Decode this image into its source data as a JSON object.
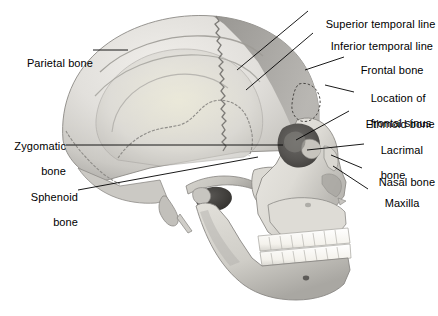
{
  "figure": {
    "width": 438,
    "height": 316,
    "background_color": "#ffffff",
    "label_color": "#000000",
    "leader_line_color": "#000000"
  },
  "palette": {
    "bone_light": "#e8e6e2",
    "bone_mid": "#cfcdc8",
    "bone_shadow": "#a9a7a3",
    "frontal_bone_gray": "#9a9894",
    "parietal_gray": "#c6c4c0",
    "suture_line": "#8a8884",
    "orbit_dark": "#4a4845",
    "meatus_dark": "#3c3a38",
    "tooth_white": "#fbfaf7",
    "outline": "#6e6c69"
  },
  "labels": {
    "left": [
      {
        "id": "parietal-bone",
        "lines": [
          "Parietal bone"
        ],
        "text": "Parietal bone",
        "align": "right",
        "x": 8,
        "y": 44,
        "leader": {
          "x1": 93,
          "y1": 50,
          "x2": 128,
          "y2": 50
        }
      },
      {
        "id": "zygomatic-bone",
        "lines": [
          "Zygomatic",
          "bone"
        ],
        "text": "Zygomatic bone",
        "align": "right",
        "x": 8,
        "y": 127,
        "leader": {
          "x1": 66,
          "y1": 145,
          "x2": 283,
          "y2": 145
        }
      },
      {
        "id": "sphenoid-bone",
        "lines": [
          "Sphenoid",
          "bone"
        ],
        "text": "Sphenoid bone",
        "align": "right",
        "x": 25,
        "y": 178,
        "leader": {
          "x1": 78,
          "y1": 190,
          "x2": 258,
          "y2": 157
        }
      }
    ],
    "right": [
      {
        "id": "superior-temporal-line",
        "lines": [
          "Superior temporal line"
        ],
        "text": "Superior temporal line",
        "align": "left",
        "x": 313,
        "y": 5,
        "leader": {
          "x1": 308,
          "y1": 11,
          "x2": 237,
          "y2": 70
        }
      },
      {
        "id": "inferior-temporal-line",
        "lines": [
          "Inferior temporal line"
        ],
        "text": "Inferior temporal line",
        "align": "left",
        "x": 318,
        "y": 27,
        "leader": {
          "x1": 313,
          "y1": 33,
          "x2": 246,
          "y2": 90
        }
      },
      {
        "id": "frontal-bone",
        "lines": [
          "Frontal bone"
        ],
        "text": "Frontal bone",
        "align": "left",
        "x": 348,
        "y": 51,
        "leader": {
          "x1": 344,
          "y1": 57,
          "x2": 305,
          "y2": 70
        }
      },
      {
        "id": "location-of-frontal-sinus",
        "lines": [
          "Location of",
          "frontal sinus"
        ],
        "text": "Location of frontal sinus",
        "align": "left",
        "x": 358,
        "y": 79,
        "leader": {
          "x1": 354,
          "y1": 92,
          "x2": 325,
          "y2": 85
        }
      },
      {
        "id": "ethmoid-bone",
        "lines": [
          "Ethmoid bone"
        ],
        "text": "Ethmoid bone",
        "align": "left",
        "x": 353,
        "y": 105,
        "leader": {
          "x1": 349,
          "y1": 111,
          "x2": 296,
          "y2": 140
        }
      },
      {
        "id": "lacrimal-bone",
        "lines": [
          "Lacrimal",
          "bone"
        ],
        "text": "Lacrimal bone",
        "align": "left",
        "x": 368,
        "y": 131,
        "leader": {
          "x1": 364,
          "y1": 144,
          "x2": 307,
          "y2": 150
        }
      },
      {
        "id": "nasal-bone",
        "lines": [
          "Nasal bone"
        ],
        "text": "Nasal bone",
        "align": "left",
        "x": 366,
        "y": 163,
        "leader": {
          "x1": 362,
          "y1": 168,
          "x2": 331,
          "y2": 155
        }
      },
      {
        "id": "maxilla",
        "lines": [
          "Maxilla"
        ],
        "text": "Maxilla",
        "align": "left",
        "x": 372,
        "y": 184,
        "leader": {
          "x1": 368,
          "y1": 189,
          "x2": 333,
          "y2": 166
        }
      }
    ]
  }
}
